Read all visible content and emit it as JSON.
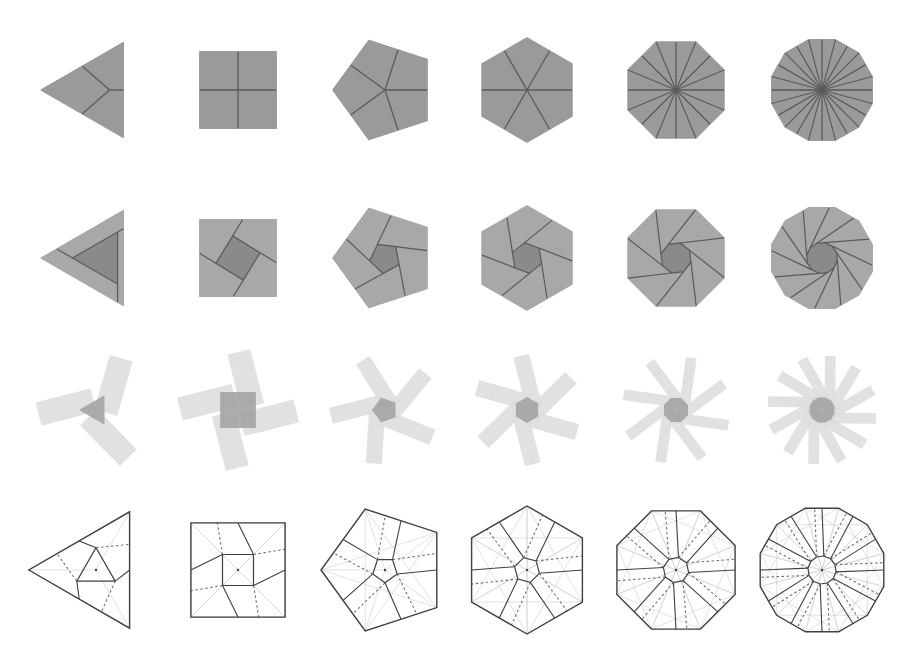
{
  "figure": {
    "columns": [
      {
        "sides": 3,
        "cx": 96,
        "label": "triangle"
      },
      {
        "sides": 4,
        "cx": 238,
        "label": "square"
      },
      {
        "sides": 5,
        "cx": 385,
        "label": "pentagon"
      },
      {
        "sides": 6,
        "cx": 527,
        "label": "hexagon"
      },
      {
        "sides": 8,
        "cx": 676,
        "label": "octagon"
      },
      {
        "sides": 12,
        "cx": 822,
        "label": "dodecagon"
      }
    ],
    "rows": [
      {
        "name": "folded-radial",
        "cy": 90,
        "radius": 52,
        "style": "filled-radial"
      },
      {
        "name": "folded-twist",
        "cy": 258,
        "radius": 52,
        "style": "filled-twist"
      },
      {
        "name": "unfolded-flaps",
        "cy": 410,
        "radius": 54,
        "style": "translucent-star"
      },
      {
        "name": "crease-pattern",
        "cy": 570,
        "radius": 64,
        "style": "crease-pattern"
      }
    ],
    "colors": {
      "background": "#ffffff",
      "fill": "#9a9a9a",
      "fill_light": "#a8a8a8",
      "fill_center": "#8a8a8a",
      "crease": "#5a5a5a",
      "flap": "#dcdcdc",
      "flap_center": "#a0a0a0",
      "outline": "#404040",
      "reference": "#cfcfcf",
      "valley": "#707070"
    },
    "legend": {
      "mountain": "solid line",
      "valley": "dashed line",
      "reference": "light line"
    }
  }
}
